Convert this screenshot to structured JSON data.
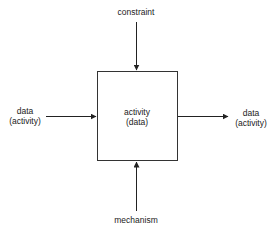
{
  "diagram": {
    "type": "IDEF0 activity box",
    "box": {
      "line1": "activity",
      "line2": "(data)"
    },
    "top": {
      "label": "constraint"
    },
    "bottom": {
      "label": "mechanism"
    },
    "left": {
      "line1": "data",
      "line2": "(activity)"
    },
    "right": {
      "line1": "data",
      "line2": "(activity)"
    }
  }
}
